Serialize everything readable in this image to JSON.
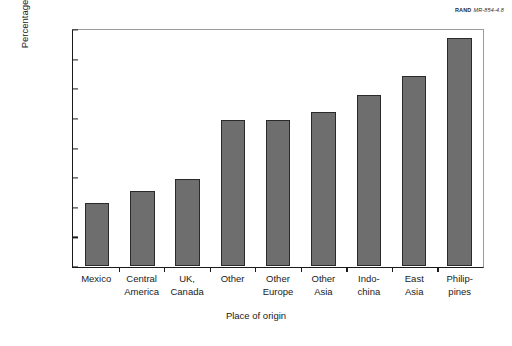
{
  "source": {
    "org": "RAND",
    "id": "MR-854-4.8"
  },
  "chart_data": {
    "type": "bar",
    "title": "",
    "xlabel": "Place of origin",
    "ylabel_line1": "Percentage arriving in 1970s who had naturalized",
    "ylabel_line2": "by 1990",
    "categories": [
      "Mexico",
      "Central America",
      "UK, Canada",
      "Other",
      "Other Europe",
      "Other Asia",
      "Indo-china",
      "East Asia",
      "Philip-pines"
    ],
    "category_lines": [
      [
        "Mexico"
      ],
      [
        "Central",
        "America"
      ],
      [
        "UK,",
        "Canada"
      ],
      [
        "Other"
      ],
      [
        "Other",
        "Europe"
      ],
      [
        "Other",
        "Asia"
      ],
      [
        "Indo-",
        "china"
      ],
      [
        "East",
        "Asia"
      ],
      [
        "Philip-",
        "pines"
      ]
    ],
    "values": [
      21.2,
      25.3,
      29.5,
      49.5,
      49.5,
      52.5,
      58.1,
      64.6,
      77.6
    ],
    "ylim": [
      0,
      80
    ],
    "yticks": [
      0,
      10,
      20,
      30,
      40,
      50,
      60,
      70,
      80
    ],
    "ytick_labels": [
      "0",
      "10",
      "20",
      "30",
      "40",
      "50",
      "60",
      "70",
      "80"
    ],
    "grid": false,
    "legend": null,
    "bar_color": "#6e6e6e",
    "bar_edge_color": "#2a2a2a"
  }
}
